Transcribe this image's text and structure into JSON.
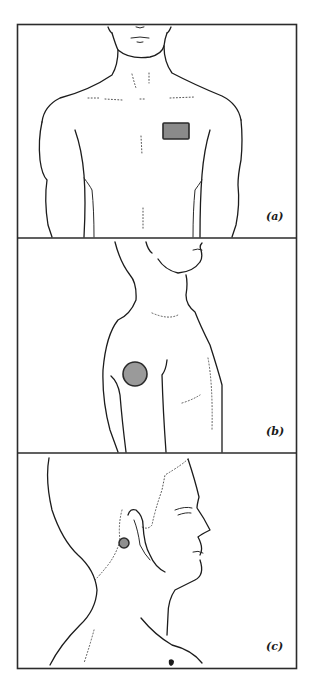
{
  "figure": {
    "panels": [
      {
        "id": "a",
        "label": "(a)",
        "view": "anterior chest",
        "electrode_shape": "rectangle",
        "electrode_color": "#8a8a8a"
      },
      {
        "id": "b",
        "label": "(b)",
        "view": "lateral upper arm / shoulder",
        "electrode_shape": "circle",
        "electrode_color": "#9a9a9a"
      },
      {
        "id": "c",
        "label": "(c)",
        "view": "lateral head and neck, behind ear",
        "electrode_shape": "small circle",
        "electrode_color": "#8f8f8f"
      }
    ],
    "colors": {
      "frame": "#2b2b2b",
      "line_art": "#1c1c1c",
      "electrode_border": "#2a2a2a",
      "background": "#ffffff"
    }
  }
}
